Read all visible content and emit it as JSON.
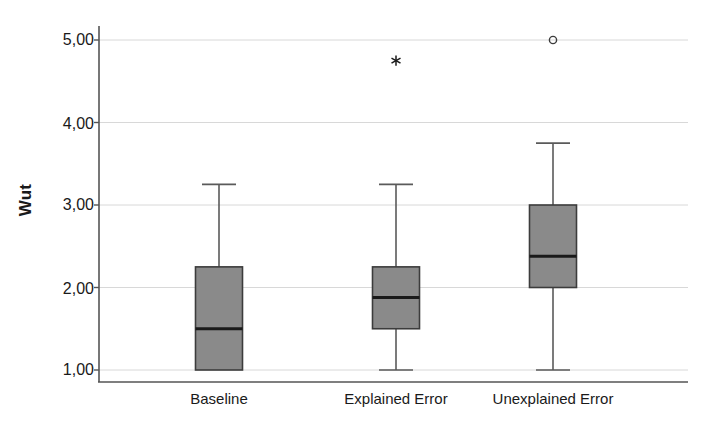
{
  "chart_data": {
    "type": "box",
    "title": "",
    "xlabel": "",
    "ylabel": "Wut",
    "ylim": [
      0.6,
      5.35
    ],
    "yticks": [
      1,
      2,
      3,
      4,
      5
    ],
    "ytick_labels": [
      "1,00",
      "2,00",
      "3,00",
      "4,00",
      "5,00"
    ],
    "grid": "horizontal",
    "legend": "none",
    "categories": [
      "Baseline",
      "Explained Error",
      "Unexplained Error"
    ],
    "series": [
      {
        "name": "Baseline",
        "whisker_low": 1.0,
        "q1": 1.0,
        "median": 1.5,
        "q3": 2.25,
        "whisker_high": 3.25,
        "outliers": [],
        "extreme_outliers": []
      },
      {
        "name": "Explained Error",
        "whisker_low": 1.0,
        "q1": 1.5,
        "median": 1.88,
        "q3": 2.25,
        "whisker_high": 3.25,
        "outliers": [],
        "extreme_outliers": [
          4.75
        ]
      },
      {
        "name": "Unexplained Error",
        "whisker_low": 1.0,
        "q1": 2.0,
        "median": 2.38,
        "q3": 3.0,
        "whisker_high": 3.75,
        "outliers": [
          5.0
        ],
        "extreme_outliers": []
      }
    ],
    "colors": {
      "box_fill": "#8a8a8a",
      "box_stroke": "#3c3c3c",
      "median_stroke": "#1a1a1a",
      "whisker_stroke": "#5a5a5a",
      "grid": "#d8d8d8",
      "axis": "#555555",
      "text": "#1a1a1a",
      "background": "#ffffff"
    }
  },
  "axis": {
    "y_title": "Wut",
    "y_tick_1": "1,00",
    "y_tick_2": "2,00",
    "y_tick_3": "3,00",
    "y_tick_4": "4,00",
    "y_tick_5": "5,00",
    "x_cat_1": "Baseline",
    "x_cat_2": "Explained Error",
    "x_cat_3": "Unexplained Error"
  }
}
